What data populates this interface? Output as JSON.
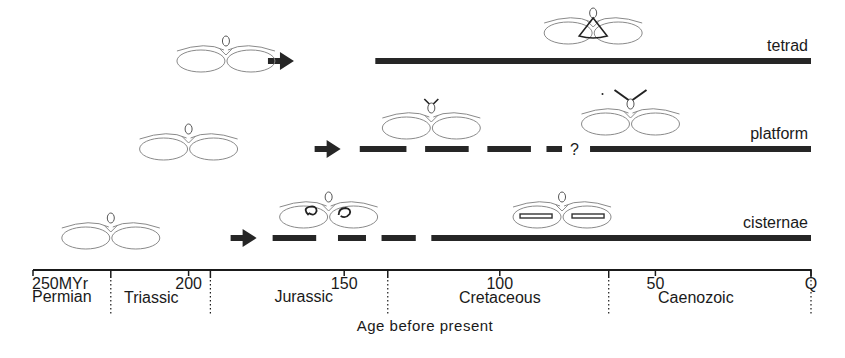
{
  "rows": [
    {
      "id": "tetrad",
      "label": "tetrad",
      "arrow_at_myr": 170,
      "segments": [
        {
          "from": 140,
          "to": 0,
          "style": "solid"
        }
      ],
      "question_mark": null,
      "icons": [
        {
          "name": "ancestral-form",
          "at_myr": 188,
          "variant": "plain"
        },
        {
          "name": "tetrad-form",
          "at_myr": 70,
          "variant": "tetrad"
        }
      ]
    },
    {
      "id": "platform",
      "label": "platform",
      "arrow_at_myr": 155,
      "segments": [
        {
          "from": 145,
          "to": 130,
          "style": "dash"
        },
        {
          "from": 124,
          "to": 110,
          "style": "dash"
        },
        {
          "from": 104,
          "to": 90,
          "style": "dash"
        },
        {
          "from": 85,
          "to": 80,
          "style": "dash"
        },
        {
          "from": 71,
          "to": 0,
          "style": "solid"
        }
      ],
      "question_mark": {
        "text": "?",
        "at_myr": 76
      },
      "icons": [
        {
          "name": "ancestral-form",
          "at_myr": 200,
          "variant": "plain"
        },
        {
          "name": "early-platform-form",
          "at_myr": 122,
          "variant": "platform-small"
        },
        {
          "name": "platform-form",
          "at_myr": 58,
          "variant": "platform-large"
        }
      ]
    },
    {
      "id": "cisternae",
      "label": "cisternae",
      "arrow_at_myr": 182,
      "segments": [
        {
          "from": 173,
          "to": 159,
          "style": "dash"
        },
        {
          "from": 152,
          "to": 143,
          "style": "dash"
        },
        {
          "from": 138,
          "to": 127,
          "style": "dash"
        },
        {
          "from": 122,
          "to": 0,
          "style": "solid"
        }
      ],
      "question_mark": null,
      "icons": [
        {
          "name": "ancestral-form",
          "at_myr": 225,
          "variant": "plain"
        },
        {
          "name": "early-cisternae-form",
          "at_myr": 155,
          "variant": "cisternae-coiled"
        },
        {
          "name": "cisternae-form",
          "at_myr": 80,
          "variant": "cisternae-flat"
        }
      ]
    }
  ],
  "axis": {
    "range_myr": [
      250,
      0
    ],
    "ticks": [
      {
        "value": 250,
        "label": "250MYr"
      },
      {
        "value": 200,
        "label": "200"
      },
      {
        "value": 150,
        "label": "150"
      },
      {
        "value": 100,
        "label": "100"
      },
      {
        "value": 50,
        "label": "50"
      },
      {
        "value": 0,
        "label": "Q"
      }
    ],
    "boundaries_myr": [
      225,
      193,
      136,
      65,
      0
    ],
    "periods": [
      {
        "name": "Permian",
        "at_myr": 240
      },
      {
        "name": "Triassic",
        "at_myr": 212
      },
      {
        "name": "Jurassic",
        "at_myr": 163
      },
      {
        "name": "Cretaceous",
        "at_myr": 100
      },
      {
        "name": "Caenozoic",
        "at_myr": 37
      }
    ],
    "xlabel": "Age before present"
  },
  "colors": {
    "ink": "#1a1a1a",
    "bar": "#262626",
    "outline": "#8a8a8a",
    "background": "#ffffff"
  }
}
